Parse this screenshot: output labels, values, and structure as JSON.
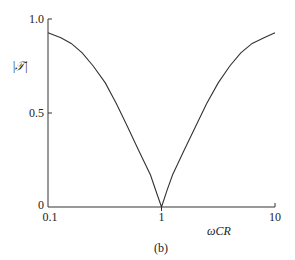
{
  "chart_data": {
    "type": "line",
    "title": "",
    "xlabel": "ωCR",
    "ylabel": "|𝒯|",
    "caption": "(b)",
    "xscale": "log",
    "xlim": [
      0.1,
      10
    ],
    "ylim": [
      0,
      1.0
    ],
    "x_ticks": [
      "0.1",
      "1",
      "10"
    ],
    "y_ticks": [
      "0",
      "0.5",
      "1.0"
    ],
    "grid": false,
    "series": [
      {
        "name": "|T|",
        "x": [
          0.1,
          0.13,
          0.16,
          0.2,
          0.25,
          0.32,
          0.4,
          0.5,
          0.63,
          0.8,
          0.9,
          1.0,
          1.12,
          1.25,
          1.58,
          2.0,
          2.5,
          3.16,
          4.0,
          5.0,
          6.3,
          8.0,
          10.0
        ],
        "y": [
          0.927,
          0.9,
          0.87,
          0.82,
          0.75,
          0.66,
          0.55,
          0.43,
          0.3,
          0.17,
          0.08,
          0.0,
          0.09,
          0.17,
          0.3,
          0.43,
          0.55,
          0.66,
          0.75,
          0.82,
          0.87,
          0.9,
          0.927
        ]
      }
    ]
  }
}
